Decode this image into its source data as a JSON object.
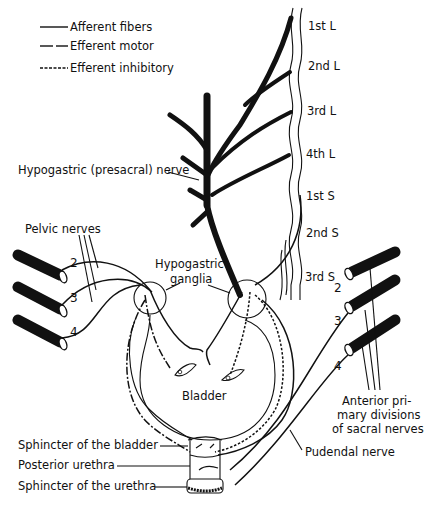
{
  "legend": {
    "items": [
      {
        "label": "Afferent fibers",
        "style": "solid"
      },
      {
        "label": "Efferent motor",
        "style": "long-dash"
      },
      {
        "label": "Efferent inhibitory",
        "style": "short-dash"
      }
    ]
  },
  "spinal_segments": [
    "1st L",
    "2nd L",
    "3rd L",
    "4th L",
    "1st S",
    "2nd S",
    "3rd S"
  ],
  "labels": {
    "hypogastric_nerve": "Hypogastric (presacral) nerve",
    "pelvic_nerves": "Pelvic nerves",
    "hypogastric_ganglia_line1": "Hypogastric",
    "hypogastric_ganglia_line2": "ganglia",
    "bladder": "Bladder",
    "sphincter_bladder": "Sphincter of the bladder",
    "posterior_urethra": "Posterior urethra",
    "sphincter_urethra": "Sphincter of the urethra",
    "pudendal_nerve": "Pudendal nerve",
    "anterior_line1": "Anterior pri-",
    "anterior_line2": "mary divisions",
    "anterior_line3": "of sacral nerves"
  },
  "left_roots": [
    "2",
    "3",
    "4"
  ],
  "right_roots": [
    "2",
    "3",
    "4"
  ],
  "colors": {
    "ink": "#111111",
    "background": "#ffffff"
  }
}
